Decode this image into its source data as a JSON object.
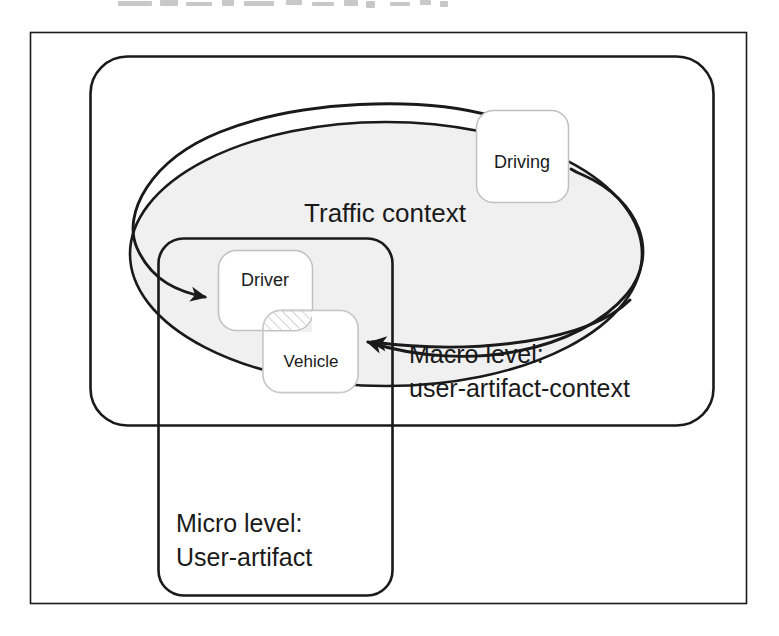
{
  "figure": {
    "kind": "nested-context-diagram",
    "outer_frame": {
      "label": ""
    },
    "colors": {
      "line": "#1a1a1a",
      "node_border": "#b8b8b8",
      "ellipse_fill": "#f0f0f0",
      "ellipse_stroke": "#1a1a1a",
      "hatch": "#cfcfcf",
      "background": "#ffffff"
    }
  },
  "regions": {
    "macro": {
      "line1": "Macro level:",
      "line2": "user-artifact-context"
    },
    "micro": {
      "line1": "Micro level:",
      "line2": "User-artifact"
    },
    "context": {
      "label": "Traffic context"
    }
  },
  "nodes": {
    "driving": {
      "label": "Driving"
    },
    "driver": {
      "label": "Driver"
    },
    "vehicle": {
      "label": "Vehicle"
    }
  },
  "arrows": [
    {
      "name": "context-to-driver",
      "from": "Traffic context",
      "to": "Driver"
    },
    {
      "name": "vehicle-to-driving",
      "from": "Vehicle",
      "to": "Driving"
    },
    {
      "name": "driving-to-vehicle",
      "from": "Driving",
      "to": "Vehicle"
    }
  ]
}
